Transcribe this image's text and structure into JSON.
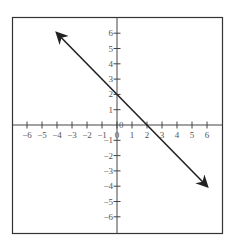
{
  "chart_data": {
    "type": "line",
    "title": "",
    "xlabel": "",
    "ylabel": "",
    "xlim": [
      -7,
      7
    ],
    "ylim": [
      -7,
      7
    ],
    "grid": false,
    "x_ticks": [
      -6,
      -5,
      -4,
      -3,
      -2,
      -1,
      0,
      1,
      2,
      3,
      4,
      5,
      6
    ],
    "y_ticks": [
      -6,
      -5,
      -4,
      -3,
      -2,
      -1,
      0,
      1,
      2,
      3,
      4,
      5,
      6
    ],
    "x_tick_labels": [
      "−6",
      "−5",
      "−4",
      "−3",
      "−2",
      "−1",
      "0",
      "1",
      "2",
      "3",
      "4",
      "5",
      "6"
    ],
    "y_tick_labels": [
      "−6",
      "−5",
      "−4",
      "−3",
      "−2",
      "−1",
      "0",
      "1",
      "2",
      "3",
      "4",
      "5",
      "6"
    ],
    "series": [
      {
        "name": "line",
        "equation": "y = -x + 2",
        "slope": -1,
        "y_intercept": 2,
        "x_intercept": 2,
        "x": [
          -4,
          6
        ],
        "y": [
          6,
          -4
        ],
        "arrows_both_ends": true,
        "color": "#222222"
      }
    ]
  }
}
